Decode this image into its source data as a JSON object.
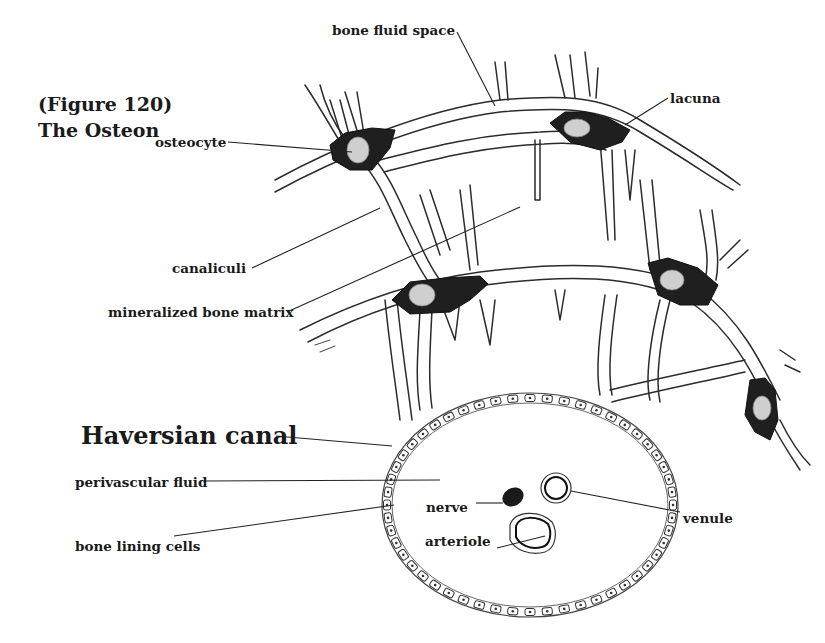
{
  "figure": {
    "number_label": "(Figure 120)",
    "title": "The Osteon"
  },
  "labels": {
    "bone_fluid_space": "bone fluid space",
    "lacuna": "lacuna",
    "osteocyte": "osteocyte",
    "canaliculi": "canaliculi",
    "mineralized_bone_matrix": "mineralized bone matrix",
    "haversian_canal": "Haversian canal",
    "perivascular_fluid": "perivascular fluid",
    "nerve": "nerve",
    "venule": "venule",
    "arteriole": "arteriole",
    "bone_lining_cells": "bone lining cells"
  }
}
